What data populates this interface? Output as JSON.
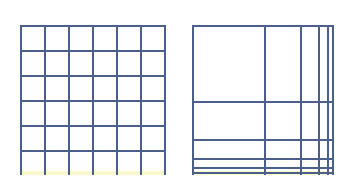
{
  "colors": {
    "background": "#ffffff",
    "line": "#4a5f8a",
    "band": "#fbf8cc"
  },
  "panels": [
    {
      "name": "uniform-grid",
      "x": 20,
      "y": 25,
      "width": 145,
      "height": 150,
      "vertical_lines": [
        20,
        44,
        68,
        92,
        116,
        140,
        164
      ],
      "horizontal_lines": [
        25,
        50,
        75,
        100,
        125,
        150
      ],
      "line_bottom": 175,
      "line_right": 165
    },
    {
      "name": "nonuniform-grid",
      "x": 192,
      "y": 25,
      "width": 141,
      "height": 150,
      "vertical_lines": [
        192,
        264,
        300,
        318,
        327,
        332
      ],
      "horizontal_lines": [
        25,
        101,
        139,
        158,
        167,
        172
      ],
      "line_bottom": 175,
      "line_right": 333
    }
  ]
}
